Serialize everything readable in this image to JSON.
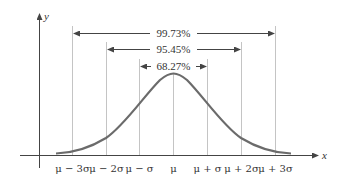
{
  "diagram": {
    "axes": {
      "x_label": "x",
      "y_label": "y"
    },
    "tick_labels": [
      "μ − 3σ",
      "μ − 2σ",
      "μ − σ",
      "μ",
      "μ + σ",
      "μ + 2σ",
      "μ + 3σ"
    ],
    "intervals": [
      {
        "label": "99.73%",
        "range": "μ ± 3σ"
      },
      {
        "label": "95.45%",
        "range": "μ ± 2σ"
      },
      {
        "label": "68.27%",
        "range": "μ ± σ"
      }
    ],
    "colors": {
      "curve": "#6b6b6b",
      "axis": "#444444",
      "guides": "#bfbfbf"
    }
  }
}
